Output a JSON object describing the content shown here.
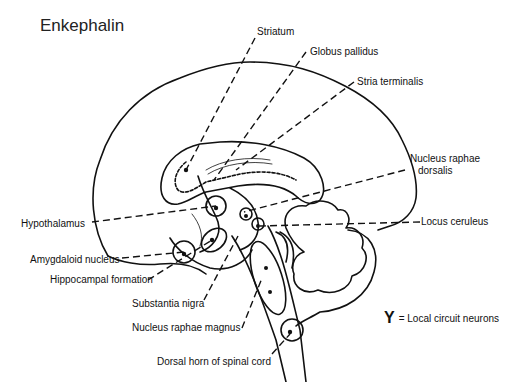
{
  "title": "Enkephalin",
  "labels": {
    "striatum": "Striatum",
    "globus_pallidus": "Globus pallidus",
    "stria_terminalis": "Stria terminalis",
    "nucleus_raphae_dorsalis_1": "Nucleus raphae",
    "nucleus_raphae_dorsalis_2": "dorsalis",
    "locus_ceruleus": "Locus ceruleus",
    "hypothalamus": "Hypothalamus",
    "amygdaloid_nucleus": "Amygdaloid nucleus",
    "hippocampal_formation": "Hippocampal formation",
    "substantia_nigra": "Substantia nigra",
    "nucleus_raphae_magnus": "Nucleus raphae magnus",
    "dorsal_horn": "Dorsal horn of spinal cord"
  },
  "legend": {
    "icon": "local-circuit-neuron-icon",
    "glyph": "Y",
    "text": "= Local circuit neurons"
  },
  "colors": {
    "line": "#111111",
    "background": "#ffffff"
  }
}
